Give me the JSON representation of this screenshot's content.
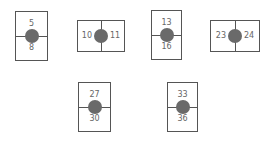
{
  "figure": {
    "colors": {
      "border": "#555555",
      "dot": "#6a6a6a",
      "text": "#666666",
      "background": "#ffffff"
    },
    "boxes": [
      {
        "orientation": "vertical",
        "first": "5",
        "second": "8"
      },
      {
        "orientation": "horizontal",
        "first": "10",
        "second": "11"
      },
      {
        "orientation": "vertical",
        "first": "13",
        "second": "16"
      },
      {
        "orientation": "horizontal",
        "first": "23",
        "second": "24"
      },
      {
        "orientation": "vertical",
        "first": "27",
        "second": "30"
      },
      {
        "orientation": "vertical",
        "first": "33",
        "second": "36"
      }
    ]
  }
}
